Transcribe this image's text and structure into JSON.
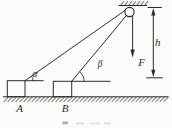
{
  "figure": {
    "labels": {
      "angle_alpha": "α",
      "angle_beta": "β",
      "force": "F",
      "height": "h",
      "block_a": "A",
      "block_b": "B"
    },
    "colors": {
      "ink": "#2b2b2b",
      "paper": "#fcfcfa"
    }
  }
}
